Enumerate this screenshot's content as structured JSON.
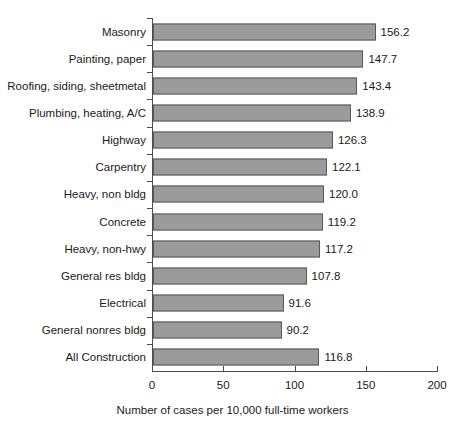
{
  "chart_data": {
    "type": "bar",
    "orientation": "horizontal",
    "title": "",
    "subtitle": "",
    "xlabel": "Number of cases per 10,000 full-time workers",
    "ylabel": "",
    "xlim": [
      0,
      200
    ],
    "xticks": [
      0,
      50,
      100,
      150,
      200
    ],
    "xtick_labels": [
      "0",
      "50",
      "100",
      "150",
      "200"
    ],
    "grid": false,
    "legend": null,
    "bar_color": "#9b9b9b",
    "bar_border_color": "#5a5a5a",
    "axis_color": "#4d4d4d",
    "background": "#ffffff",
    "categories": [
      "Masonry",
      "Painting, paper",
      "Roofing, siding, sheetmetal",
      "Plumbing, heating, A/C",
      "Highway",
      "Carpentry",
      "Heavy, non bldg",
      "Concrete",
      "Heavy, non-hwy",
      "General res bldg",
      "Electrical",
      "General nonres bldg",
      "All Construction"
    ],
    "values": [
      156.2,
      147.7,
      143.4,
      138.9,
      126.3,
      122.1,
      120.0,
      119.2,
      117.2,
      107.8,
      91.6,
      90.2,
      116.8
    ],
    "value_labels": [
      "156.2",
      "147.7",
      "143.4",
      "138.9",
      "126.3",
      "122.1",
      "120.0",
      "119.2",
      "117.2",
      "107.8",
      "91.6",
      "90.2",
      "116.8"
    ]
  }
}
